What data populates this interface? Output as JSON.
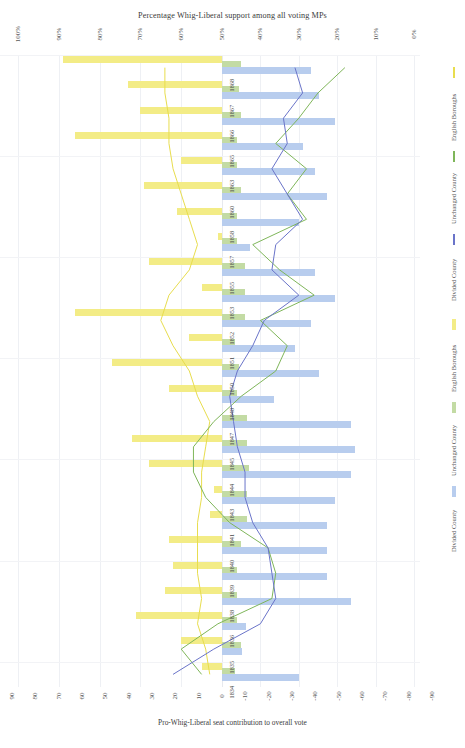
{
  "chart_data": {
    "type": "bar",
    "title": "Percentage Whig-Liberal support among all voting MPs",
    "xlabel_top": "Percentage Whig-Liberal support among all voting MPs",
    "xlabel_bottom": "Pro-Whig-Liberal seat contribution to overall vote",
    "orientation": "horizontal-diverging",
    "grid": true,
    "legend_position": "right",
    "top_axis": {
      "ticks": [
        "100%",
        "90%",
        "80%",
        "70%",
        "60%",
        "50%",
        "40%",
        "30%",
        "20%",
        "10%",
        "0%"
      ],
      "range": [
        100,
        0
      ],
      "direction": "descending-left-to-right"
    },
    "bottom_axis": {
      "ticks": [
        "90",
        "80",
        "70",
        "60",
        "50",
        "40",
        "30",
        "20",
        "10",
        "0",
        "-10",
        "-20",
        "-30",
        "-40",
        "-50",
        "-60",
        "-70",
        "-80",
        "-90"
      ],
      "range": [
        90,
        -90
      ],
      "direction": "descending-left-to-right"
    },
    "categories": [
      "1868",
      "1867",
      "1866",
      "1865",
      "1863",
      "1860",
      "1858",
      "1857",
      "1855",
      "1853",
      "1852",
      "1851",
      "1850",
      "1848",
      "1847",
      "1845",
      "1844",
      "1843",
      "1841",
      "1840",
      "1839",
      "1838",
      "1836",
      "1835",
      "1834"
    ],
    "series": [
      {
        "name": "English Boroughs",
        "color": "#f3ec86",
        "line_color": "#e8dd4e",
        "bar_values": [
          89,
          73,
          70,
          86,
          60,
          69,
          61,
          51,
          68,
          55,
          86,
          58,
          77,
          63,
          50,
          72,
          68,
          52,
          53,
          63,
          62,
          64,
          71,
          60,
          55
        ],
        "line_values": [
          64,
          64,
          63,
          63,
          62,
          60,
          58,
          56,
          58,
          63,
          65,
          62,
          58,
          56,
          53,
          54,
          55,
          55,
          56,
          56,
          56,
          55,
          56,
          54,
          53
        ]
      },
      {
        "name": "Unchanged County",
        "color": "#c3dba4",
        "line_color": "#7fb65a",
        "bar_values": [
          44,
          43,
          44,
          42,
          42,
          44,
          42,
          42,
          46,
          46,
          46,
          41,
          43,
          42,
          47,
          47,
          48,
          47,
          47,
          44,
          42,
          42,
          42,
          44,
          41
        ],
        "line_values": [
          18,
          25,
          30,
          36,
          28,
          33,
          28,
          42,
          35,
          26,
          40,
          33,
          36,
          45,
          52,
          57,
          57,
          54,
          48,
          38,
          36,
          37,
          51,
          60,
          55
        ]
      },
      {
        "name": "Divided County",
        "color": "#b8cdee",
        "line_color": "#6a74c9",
        "bar_values": [
          60,
          62,
          66,
          58,
          61,
          64,
          57,
          45,
          61,
          66,
          60,
          56,
          62,
          51,
          70,
          71,
          70,
          66,
          64,
          64,
          64,
          70,
          44,
          43,
          57
        ],
        "line_values": [
          31,
          29,
          34,
          33,
          37,
          33,
          29,
          36,
          37,
          30,
          39,
          42,
          46,
          48,
          47,
          46,
          44,
          44,
          42,
          38,
          37,
          36,
          40,
          52,
          62
        ]
      }
    ],
    "legend_lines": [
      {
        "name": "English Boroughs",
        "color": "#e8dd4e"
      },
      {
        "name": "Unchanged County",
        "color": "#7fb65a"
      },
      {
        "name": "Divided County",
        "color": "#6a74c9"
      }
    ],
    "legend_bars": [
      {
        "name": "English Boroughs",
        "color": "#f3ec86"
      },
      {
        "name": "Unchanged County",
        "color": "#c3dba4"
      },
      {
        "name": "Divided County",
        "color": "#b8cdee"
      }
    ]
  }
}
